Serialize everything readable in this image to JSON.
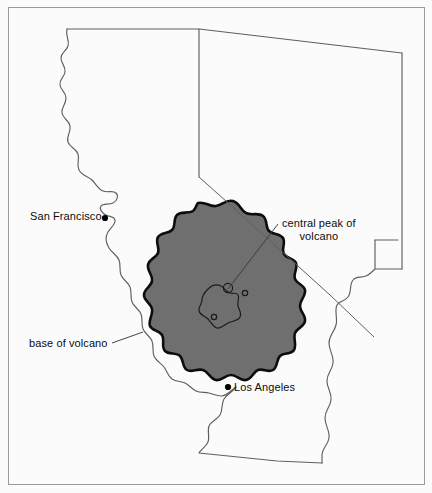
{
  "figure": {
    "kind": "map-illustration",
    "frame": {
      "border_color": "#9a9a9a",
      "background_color": "#fbfbfb"
    }
  },
  "colors": {
    "background": "#fbfbfb",
    "frame_border": "#9a9a9a",
    "state_outline": "#5f5f5f",
    "volcano_fill": "#6f6f6f",
    "volcano_outline": "#0d0d0d",
    "crater_outline": "#1a1a1a",
    "leader_line": "#3a3a3a",
    "label_text": "#0d0d0d",
    "city_dot": "#000000"
  },
  "labels": {
    "san_francisco": "San Francisco",
    "los_angeles": "Los Angeles",
    "base_of_volcano": "base of volcano",
    "central_peak_line1": "central peak of",
    "central_peak_line2": "volcano"
  },
  "cities": [
    {
      "name": "San Francisco",
      "marker": "city-dot"
    },
    {
      "name": "Los Angeles",
      "marker": "city-dot"
    }
  ],
  "annotations": [
    {
      "name": "base-of-volcano",
      "text": "base of volcano",
      "has_leader_line": true
    },
    {
      "name": "central-peak-of-volcano",
      "text": "central peak of volcano",
      "has_leader_line": true
    }
  ],
  "features": {
    "volcano_base": "large irregular shaded blob covering central/southern California and western Nevada",
    "central_peak": "small irregular closed outline near the center of the blob",
    "secondary_vents": 3
  }
}
